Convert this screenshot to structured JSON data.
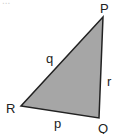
{
  "figure": {
    "type": "triangle",
    "fill_color": "#a6a6a6",
    "stroke_color": "#222222",
    "top_text_cut": "...",
    "vertices": [
      {
        "label": "P",
        "x": 103,
        "y": 17
      },
      {
        "label": "Q",
        "x": 99,
        "y": 118
      },
      {
        "label": "R",
        "x": 21,
        "y": 106
      }
    ],
    "sides": [
      {
        "label": "q",
        "between": "P-R"
      },
      {
        "label": "r",
        "between": "P-Q"
      },
      {
        "label": "p",
        "between": "R-Q"
      }
    ]
  }
}
